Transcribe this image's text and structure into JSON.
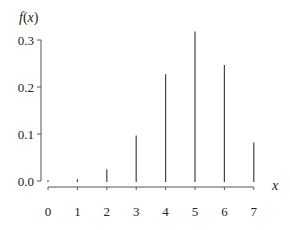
{
  "chart_data": {
    "type": "bar",
    "subtype": "stick",
    "title": "",
    "xlabel": "x",
    "ylabel": "f(x)",
    "categories": [
      "0",
      "1",
      "2",
      "3",
      "4",
      "5",
      "6",
      "7"
    ],
    "x": [
      0,
      1,
      2,
      3,
      4,
      5,
      6,
      7
    ],
    "values": [
      0.0002,
      0.0036,
      0.025,
      0.097,
      0.227,
      0.318,
      0.247,
      0.082
    ],
    "ylim": [
      0,
      0.32
    ],
    "yticks": [
      0.0,
      0.1,
      0.2,
      0.3
    ],
    "ytick_labels": [
      "0.0",
      "0.1",
      "0.2",
      "0.3"
    ],
    "xticks": [
      0,
      1,
      2,
      3,
      4,
      5,
      6,
      7
    ],
    "xtick_labels": [
      "0",
      "1",
      "2",
      "3",
      "4",
      "5",
      "6",
      "7"
    ],
    "grid": false,
    "legend": null,
    "colors": {
      "stick": "#444444",
      "axis": "#555555",
      "text": "#222222"
    }
  },
  "labels": {
    "ylabel_f": "f",
    "ylabel_paren_open": "(",
    "ylabel_x": "x",
    "ylabel_paren_close": ")",
    "xlabel": "x"
  }
}
